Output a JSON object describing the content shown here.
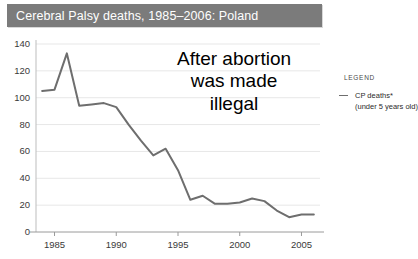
{
  "title": {
    "text": "Cerebral Palsy deaths, 1985–2006: Poland",
    "bar_color": "#7b7b7b",
    "text_color": "#ffffff"
  },
  "annotation": {
    "line1": "After abortion",
    "line2": "was made",
    "line3": "illegal"
  },
  "legend": {
    "heading": "LEGEND",
    "entry_label": "CP deaths*",
    "entry_sublabel": "(under 5 years old)",
    "swatch_color": "#6e6e6e",
    "position": "right"
  },
  "chart_data": {
    "type": "line",
    "title": "Cerebral Palsy deaths, 1985–2006: Poland",
    "xlabel": "",
    "ylabel": "",
    "xlim": [
      1983.5,
      2006.5
    ],
    "ylim": [
      0,
      140
    ],
    "grid": true,
    "line_color": "#6e6e6e",
    "y_ticks": [
      0,
      20,
      40,
      60,
      80,
      100,
      120,
      140
    ],
    "y_tick_labels": [
      "0",
      "20",
      "40",
      "60",
      "80",
      "100",
      "120",
      "140"
    ],
    "x_ticks": [
      1985,
      1990,
      1995,
      2000,
      2005
    ],
    "x_tick_labels": [
      "1985",
      "1990",
      "1995",
      "2000",
      "2005"
    ],
    "series": [
      {
        "name": "CP deaths* (under 5 years old)",
        "x": [
          1984,
          1985,
          1986,
          1987,
          1988,
          1989,
          1990,
          1991,
          1992,
          1993,
          1994,
          1995,
          1996,
          1997,
          1998,
          1999,
          2000,
          2001,
          2002,
          2003,
          2004,
          2005,
          2006
        ],
        "values": [
          105,
          106,
          133,
          94,
          95,
          96,
          93,
          80,
          68,
          57,
          62,
          46,
          24,
          27,
          21,
          21,
          22,
          25,
          23,
          16,
          11,
          13,
          13
        ]
      }
    ]
  }
}
